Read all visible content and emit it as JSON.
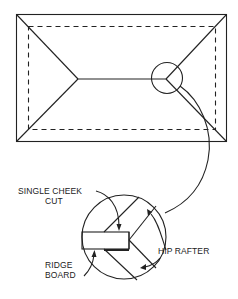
{
  "diagram": {
    "plan": {
      "outer_outline": "roof outline",
      "inner_outline": "wall line (dashed)",
      "ridge": "ridge line",
      "hips": 4,
      "callout": "detail circle at ridge/hip junction"
    },
    "detail": {
      "labels": {
        "single_cheek_cut_line1": "SINGLE CHEEK",
        "single_cheek_cut_line2": "CUT",
        "hip_rafter": "HIP RAFTER",
        "ridge_board_line1": "RIDGE",
        "ridge_board_line2": "BOARD"
      }
    },
    "colors": {
      "line": "#222222",
      "background": "#ffffff"
    }
  }
}
